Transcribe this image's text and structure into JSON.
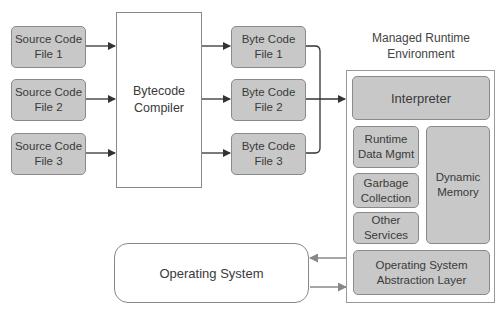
{
  "source_files": [
    {
      "label": "Source Code\nFile 1"
    },
    {
      "label": "Source Code\nFile 2"
    },
    {
      "label": "Source Code\nFile 3"
    }
  ],
  "compiler": {
    "label": "Bytecode\nCompiler"
  },
  "bytecode_files": [
    {
      "label": "Byte Code\nFile 1"
    },
    {
      "label": "Byte Code\nFile 2"
    },
    {
      "label": "Byte Code\nFile 3"
    }
  ],
  "runtime": {
    "title": "Managed Runtime\nEnvironment",
    "interpreter": "Interpreter",
    "runtime_data": "Runtime\nData Mgmt",
    "garbage_collection": "Garbage\nCollection",
    "other_services": "Other\nServices",
    "dynamic_memory": "Dynamic\nMemory",
    "os_abstraction": "Operating System\nAbstraction Layer"
  },
  "operating_system": {
    "label": "Operating System"
  },
  "colors": {
    "box_fill": "#c8c8c8",
    "box_border": "#8a8a8a",
    "arrow": "#333333",
    "os_arrow": "#888888"
  }
}
